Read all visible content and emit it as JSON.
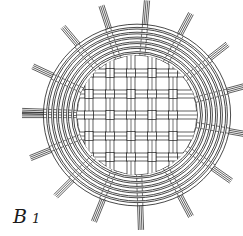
{
  "figure": {
    "label_letter": "B",
    "label_number": "1",
    "line_color": "#1a1a1a",
    "background": "#ffffff",
    "center": [
      137,
      115
    ],
    "woven_radius": 60,
    "ring_radii": [
      62,
      67,
      72,
      77,
      82,
      87,
      92
    ],
    "spoke_angles": [
      -155,
      -130,
      -108,
      -85,
      -62,
      -38,
      -15,
      10,
      35,
      62,
      88,
      112,
      135,
      158,
      180,
      -178
    ],
    "spoke_inner": 60,
    "spoke_outer": 115,
    "weave_strips_v": [
      -48,
      -27,
      -6,
      15,
      36
    ],
    "weave_strips_h": [
      -42,
      -21,
      0,
      21,
      42
    ]
  }
}
